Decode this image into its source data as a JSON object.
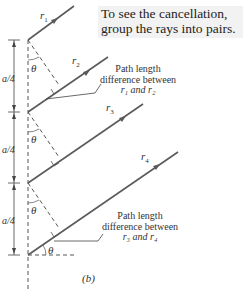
{
  "callout": {
    "line1": "To see the cancellation,",
    "line2": "group the rays into pairs."
  },
  "rays": [
    {
      "name": "r1",
      "label": "r",
      "sub": "1"
    },
    {
      "name": "r2",
      "label": "r",
      "sub": "2"
    },
    {
      "name": "r3",
      "label": "r",
      "sub": "3"
    },
    {
      "name": "r4",
      "label": "r",
      "sub": "4"
    }
  ],
  "spacing_label": "a/4",
  "angle_label": "θ",
  "notes": [
    {
      "line1": "Path length",
      "line2": "difference between",
      "line3": "r₁ and r₂"
    },
    {
      "line1": "Path length",
      "line2": "difference between",
      "line3": "r₃ and r₄"
    }
  ],
  "panel_label": "(b)",
  "colors": {
    "ray": "#555555",
    "dash": "#555555",
    "callout_bg": "#f2f2f2"
  }
}
